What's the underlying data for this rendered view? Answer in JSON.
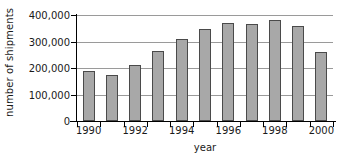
{
  "chart_data": {
    "type": "bar",
    "title": "",
    "xlabel": "year",
    "ylabel": "number of shipments",
    "categories": [
      "1990",
      "1991",
      "1992",
      "1993",
      "1994",
      "1995",
      "1996",
      "1997",
      "1998",
      "1999",
      "2000"
    ],
    "values": [
      190000,
      172000,
      212000,
      264000,
      308000,
      347000,
      371000,
      365000,
      380000,
      359000,
      260000
    ],
    "ylim": [
      0,
      400000
    ],
    "y_ticks": [
      0,
      100000,
      200000,
      300000,
      400000
    ],
    "y_tick_labels": [
      "0",
      "100,000",
      "200,000",
      "300,000",
      "400,000"
    ],
    "x_tick_labels": [
      "1990",
      "1992",
      "1994",
      "1996",
      "1998",
      "2000"
    ],
    "x_labeled_categories": [
      "1990",
      "1992",
      "1994",
      "1996",
      "1998",
      "2000"
    ],
    "grid": true,
    "grid_axis": "y",
    "legend": null,
    "bar_color": "#a8a8a8",
    "bar_edge_color": "#4a4a4a",
    "gridline_color": "#9a9a9a",
    "axis_color": "#000000",
    "background_color": "#ffffff"
  }
}
